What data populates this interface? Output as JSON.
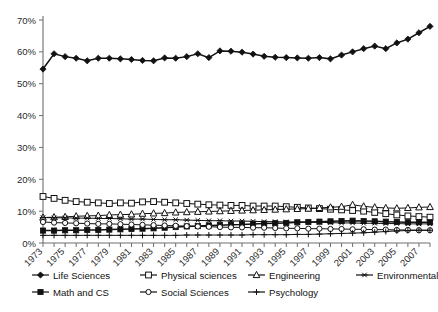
{
  "chart_data": {
    "type": "line",
    "title": "",
    "xlabel": "",
    "ylabel": "",
    "grid": false,
    "legend_position": "bottom",
    "ylim": [
      0,
      70
    ],
    "ytick_labels": [
      "0%",
      "10%",
      "20%",
      "30%",
      "40%",
      "50%",
      "60%",
      "70%"
    ],
    "ytick_values": [
      0,
      10,
      20,
      30,
      40,
      50,
      60,
      70
    ],
    "xlim": [
      1973,
      2008
    ],
    "x": [
      1973,
      1974,
      1975,
      1976,
      1977,
      1978,
      1979,
      1980,
      1981,
      1982,
      1983,
      1984,
      1985,
      1986,
      1987,
      1988,
      1989,
      1990,
      1991,
      1992,
      1993,
      1994,
      1995,
      1996,
      1997,
      1998,
      1999,
      2000,
      2001,
      2002,
      2003,
      2004,
      2005,
      2006,
      2007,
      2008
    ],
    "xtick_labels": [
      "1973",
      "1975",
      "1977",
      "1979",
      "1981",
      "1983",
      "1985",
      "1987",
      "1989",
      "1991",
      "1993",
      "1995",
      "1997",
      "1999",
      "2001",
      "2003",
      "2005",
      "2007"
    ],
    "xtick_values": [
      1973,
      1975,
      1977,
      1979,
      1981,
      1983,
      1985,
      1987,
      1989,
      1991,
      1993,
      1995,
      1997,
      1999,
      2001,
      2003,
      2005,
      2007
    ],
    "series": [
      {
        "name": "Life Sciences",
        "marker": "filled-diamond",
        "values": [
          54.6,
          59.4,
          58.5,
          58.0,
          57.2,
          58.0,
          58.0,
          57.8,
          57.6,
          57.3,
          57.2,
          58.1,
          58.0,
          58.5,
          59.4,
          58.2,
          60.3,
          60.2,
          59.9,
          59.3,
          58.6,
          58.3,
          58.2,
          58.1,
          58.0,
          58.2,
          57.8,
          59.0,
          60.0,
          61.0,
          61.8,
          61.0,
          62.8,
          64.0,
          66.0,
          68.0
        ]
      },
      {
        "name": "Physical sciences",
        "marker": "open-square",
        "values": [
          14.6,
          14.0,
          13.4,
          13.0,
          12.8,
          12.6,
          12.4,
          12.6,
          12.5,
          12.9,
          13.0,
          12.8,
          12.6,
          12.4,
          12.2,
          12.0,
          11.9,
          11.8,
          11.8,
          11.6,
          11.6,
          11.6,
          11.4,
          11.2,
          11.0,
          10.8,
          10.6,
          10.4,
          10.2,
          10.0,
          9.6,
          9.2,
          8.8,
          8.5,
          8.3,
          8.1
        ]
      },
      {
        "name": "Engineering",
        "marker": "open-triangle",
        "values": [
          8.0,
          8.1,
          8.2,
          8.4,
          8.5,
          8.6,
          8.8,
          8.9,
          9.0,
          9.2,
          9.3,
          9.4,
          9.6,
          9.7,
          9.8,
          9.9,
          10.0,
          10.1,
          10.2,
          10.3,
          10.4,
          10.5,
          10.6,
          10.7,
          10.8,
          11.0,
          11.2,
          11.4,
          12.0,
          11.5,
          11.2,
          11.0,
          10.9,
          11.0,
          11.2,
          11.3
        ]
      },
      {
        "name": "Environmental",
        "marker": "asterisk",
        "values": [
          8.0,
          7.9,
          7.9,
          7.8,
          7.8,
          7.7,
          7.7,
          7.6,
          7.5,
          7.5,
          7.4,
          7.3,
          7.3,
          7.2,
          7.1,
          7.0,
          7.0,
          6.9,
          6.9,
          6.8,
          6.7,
          6.7,
          6.6,
          6.6,
          6.5,
          6.5,
          6.4,
          6.3,
          6.3,
          6.2,
          6.2,
          6.1,
          6.1,
          6.0,
          6.0,
          6.0
        ]
      },
      {
        "name": "Math and CS",
        "marker": "filled-square",
        "values": [
          3.9,
          3.9,
          4.0,
          4.0,
          4.1,
          4.1,
          4.2,
          4.3,
          4.4,
          4.5,
          4.6,
          4.8,
          5.0,
          5.2,
          5.3,
          5.5,
          5.6,
          5.7,
          5.8,
          6.0,
          6.1,
          6.2,
          6.3,
          6.5,
          6.6,
          6.7,
          6.8,
          6.9,
          7.0,
          6.9,
          6.8,
          6.7,
          6.6,
          6.5,
          6.5,
          6.5
        ]
      },
      {
        "name": "Social Sciences",
        "marker": "open-circle",
        "values": [
          6.6,
          6.4,
          6.3,
          6.2,
          6.1,
          6.0,
          6.0,
          5.9,
          5.8,
          5.7,
          5.6,
          5.5,
          5.4,
          5.3,
          5.2,
          5.1,
          5.0,
          4.9,
          4.9,
          4.8,
          4.8,
          4.7,
          4.6,
          4.6,
          4.5,
          4.5,
          4.4,
          4.4,
          4.3,
          4.3,
          4.2,
          4.2,
          4.1,
          4.1,
          4.0,
          4.0
        ]
      },
      {
        "name": "Psychology",
        "marker": "plus",
        "values": [
          2.4,
          2.4,
          2.4,
          2.4,
          2.4,
          2.4,
          2.4,
          2.4,
          2.4,
          2.4,
          2.4,
          2.4,
          2.4,
          2.5,
          2.5,
          2.5,
          2.5,
          2.5,
          2.5,
          2.6,
          2.6,
          2.6,
          2.6,
          2.7,
          2.7,
          2.8,
          2.9,
          3.0,
          3.1,
          3.2,
          3.4,
          3.6,
          3.8,
          3.9,
          4.0,
          4.0
        ]
      }
    ]
  },
  "legend": {
    "row1": [
      "Life Sciences",
      "Physical sciences",
      "Engineering",
      "Environmental"
    ],
    "row2": [
      "Math and CS",
      "Social Sciences",
      "Psychology"
    ]
  },
  "colors": {
    "line": "#111111",
    "axis": "#6e6e6e",
    "text": "#1a1a1a",
    "background": "#ffffff"
  }
}
